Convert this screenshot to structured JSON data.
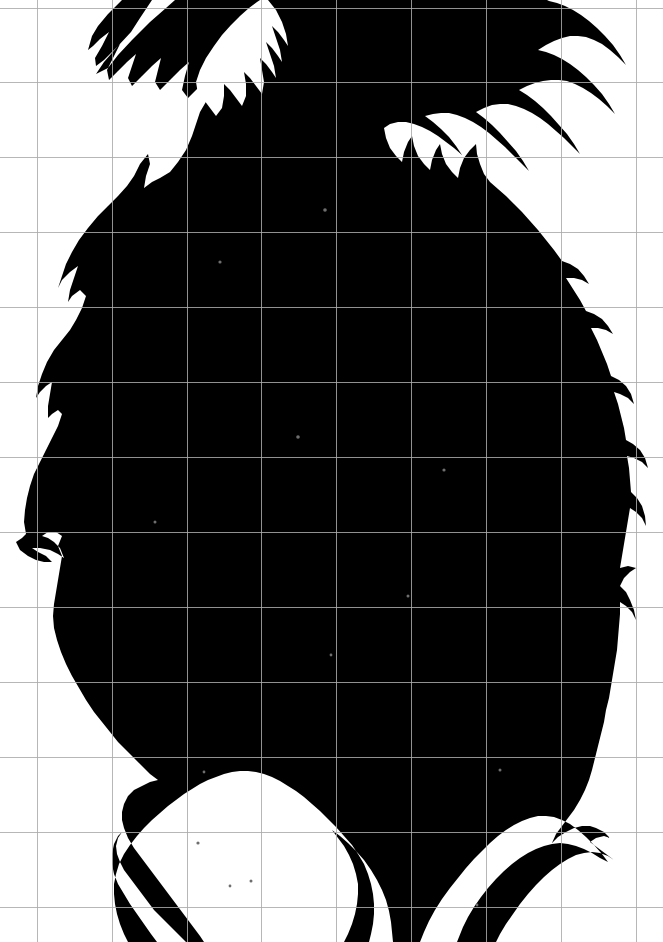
{
  "image": {
    "kind": "photograph-silhouette",
    "subject_label": "pineapple-silhouette",
    "description": "High-contrast black silhouette of a pineapple with a spiky serrated crown of leaves at the top and long serrated leaves at the bottom, photographed against a white background with a faint measurement grid overlay.",
    "width_px": 663,
    "height_px": 942,
    "background_color": "#ffffff",
    "silhouette_color": "#000000",
    "grid_line_color": "#aaaaaa",
    "grid_spacing_px": 74.8,
    "grid_origin_x_px": 37,
    "grid_origin_y_px": 82,
    "grid_vertical_count": 9,
    "grid_horizontal_count": 12,
    "grid_visible": true
  },
  "grid": {
    "vertical_x": [
      37,
      112,
      187,
      261,
      336,
      411,
      486,
      561,
      636
    ],
    "horizontal_y": [
      8,
      82,
      157,
      232,
      307,
      382,
      457,
      532,
      607,
      682,
      757,
      832,
      907
    ]
  },
  "silhouette": {
    "name": "pineapple-silhouette-path",
    "bbox": {
      "x": 18,
      "y": 0,
      "width": 630,
      "height": 942
    },
    "path": "M 175,0 L 166,8 L 150,22 L 132,40 L 118,55 L 108,68 L 96,74 L 104,62 L 118,46 L 131,32 L 140,18 L 148,6 L 152,0 L 122,0 L 108,14 L 98,26 L 92,36 L 88,50 L 93,46 L 100,39 L 109,32 L 102,46 L 95,58 L 96,66 L 104,60 L 112,52 L 120,44 L 113,58 L 107,70 L 109,80 L 118,71 L 127,62 L 136,54 L 132,66 L 128,78 L 132,86 L 142,76 L 152,66 L 161,58 L 158,70 L 155,82 L 160,90 L 170,80 L 180,70 L 189,62 L 185,76 L 182,90 L 188,98 L 198,88 L 208,78 L 212,88 L 207,100 L 200,112 L 196,124 L 192,136 L 186,150 L 178,162 L 170,172 L 160,178 L 152,182 L 144,188 L 146,176 L 150,164 L 148,154 L 140,164 L 134,176 L 127,186 L 118,196 L 108,206 L 98,216 L 88,228 L 79,240 L 72,252 L 66,264 L 62,276 L 58,288 L 62,280 L 70,272 L 78,266 L 74,278 L 70,290 L 68,302 L 72,296 L 80,290 L 86,296 L 82,308 L 76,320 L 70,330 L 62,340 L 54,350 L 47,362 L 42,374 L 38,386 L 36,398 L 40,392 L 46,386 L 52,382 L 50,394 L 48,406 L 48,418 L 52,414 L 58,410 L 62,414 L 58,426 L 52,438 L 46,450 L 40,462 L 34,474 L 30,486 L 27,498 L 25,510 L 24,522 L 26,534 L 22,538 L 16,542 L 20,550 L 28,556 L 36,560 L 44,562 L 52,562 L 46,556 L 38,552 L 32,548 L 40,548 L 50,550 L 58,554 L 64,558 L 60,548 L 54,542 L 48,538 L 42,536 L 48,532 L 56,532 L 62,536 L 58,546 L 62,556 L 60,568 L 58,580 L 56,592 L 54,604 L 53,616 L 54,628 L 57,640 L 61,652 L 66,664 L 72,676 L 79,688 L 86,700 L 94,712 L 102,722 L 110,732 L 118,742 L 126,750 L 134,758 L 142,766 L 150,774 L 158,780 L 150,782 L 142,786 L 134,790 L 128,796 L 124,804 L 122,812 L 122,820 L 124,828 L 128,838 L 134,848 L 140,856 L 146,864 L 152,872 L 158,880 L 164,888 L 170,896 L 176,904 L 182,912 L 188,920 L 194,928 L 200,936 L 204,942 L 186,942 L 178,934 L 170,926 L 162,918 L 154,910 L 148,902 L 142,894 L 136,886 L 130,878 L 124,870 L 120,862 L 117,854 L 116,846 L 118,838 L 122,832 L 118,836 L 114,844 L 112,854 L 112,864 L 114,874 L 118,884 L 124,894 L 130,904 L 137,914 L 144,924 L 151,934 L 157,942 L 128,942 L 124,934 L 120,924 L 117,914 L 115,904 L 114,894 L 114,884 L 116,874 L 119,864 L 124,854 L 130,845 L 137,836 L 144,828 L 152,820 L 160,813 L 168,806 L 176,800 L 184,794 L 192,789 L 200,784 L 208,780 L 216,777 L 224,774 L 232,772 L 240,771 L 248,771 L 256,772 L 264,774 L 272,777 L 280,781 L 288,786 L 296,791 L 304,797 L 312,804 L 320,811 L 328,819 L 336,827 L 344,836 L 352,845 L 358,854 L 364,864 L 368,874 L 371,884 L 373,894 L 374,904 L 374,914 L 373,924 L 371,934 L 369,942 L 344,942 L 348,934 L 352,924 L 355,914 L 357,904 L 358,894 L 358,884 L 356,874 L 353,864 L 349,855 L 344,846 L 338,838 L 332,830 L 340,836 L 348,843 L 356,851 L 364,860 L 371,870 L 377,880 L 382,890 L 386,900 L 389,911 L 391,922 L 392,932 L 393,942 L 420,942 L 424,932 L 429,921 L 435,910 L 442,899 L 450,888 L 458,878 L 466,868 L 474,859 L 482,851 L 490,843 L 498,836 L 506,830 L 514,825 L 522,821 L 530,818 L 538,816 L 546,816 L 554,817 L 562,820 L 570,824 L 578,830 L 586,837 L 594,845 L 602,854 L 608,862 L 600,858 L 592,853 L 584,849 L 576,846 L 568,844 L 560,843 L 552,844 L 544,846 L 536,849 L 528,853 L 520,858 L 512,864 L 504,871 L 496,879 L 488,888 L 481,897 L 474,907 L 468,917 L 463,927 L 459,937 L 457,942 L 496,942 L 500,934 L 506,924 L 513,914 L 520,904 L 528,894 L 536,885 L 544,877 L 552,870 L 560,864 L 568,859 L 576,855 L 584,853 L 592,852 L 600,853 L 608,856 L 614,860 L 606,854 L 598,848 L 590,842 L 596,838 L 604,836 L 610,838 L 604,832 L 596,828 L 590,826 L 582,826 L 574,828 L 566,832 L 558,837 L 552,843 L 556,834 L 562,826 L 568,818 L 574,810 L 580,800 L 585,790 L 589,780 L 592,770 L 595,758 L 598,746 L 601,734 L 604,722 L 606,710 L 609,698 L 611,686 L 613,674 L 615,662 L 617,650 L 618,638 L 619,626 L 620,614 L 620,602 L 626,606 L 632,612 L 636,620 L 634,610 L 630,600 L 626,592 L 620,586 L 624,578 L 630,572 L 636,568 L 628,566 L 620,568 L 622,556 L 624,544 L 626,532 L 628,520 L 630,508 L 636,512 L 642,518 L 646,526 L 645,516 L 642,506 L 637,498 L 631,492 L 630,480 L 629,468 L 627,456 L 634,458 L 642,462 L 648,468 L 645,458 L 640,450 L 633,444 L 626,440 L 624,428 L 621,416 L 618,404 L 614,392 L 620,394 L 628,398 L 634,404 L 631,394 L 626,386 L 619,380 L 611,376 L 607,364 L 602,352 L 597,340 L 591,328 L 598,328 L 606,330 L 613,334 L 608,326 L 602,319 L 594,314 L 586,311 L 580,300 L 573,289 L 566,278 L 574,278 L 582,280 L 589,284 L 584,276 L 578,269 L 570,264 L 562,261 L 554,250 L 546,240 L 538,230 L 530,221 L 522,212 L 514,204 L 506,196 L 498,189 L 490,182 L 484,174 L 480,164 L 477,154 L 476,144 L 470,150 L 464,158 L 460,168 L 458,178 L 452,172 L 446,164 L 442,154 L 440,144 L 436,150 L 432,160 L 430,170 L 424,164 L 418,156 L 414,146 L 412,136 L 408,142 L 404,152 L 402,162 L 396,156 L 390,148 L 386,138 L 384,128 L 390,124 L 398,122 L 406,122 L 414,124 L 422,127 L 430,131 L 438,136 L 446,142 L 454,148 L 462,155 L 456,146 L 449,137 L 441,129 L 433,122 L 425,116 L 433,114 L 441,113 L 449,113 L 457,115 L 465,118 L 473,122 L 481,127 L 489,133 L 497,140 L 505,147 L 513,155 L 521,163 L 529,171 L 523,161 L 516,151 L 508,142 L 500,133 L 492,125 L 484,118 L 476,112 L 484,108 L 492,105 L 500,104 L 508,104 L 516,106 L 524,109 L 532,113 L 540,118 L 548,124 L 556,131 L 564,138 L 572,146 L 580,154 L 574,144 L 567,134 L 559,125 L 551,116 L 543,108 L 535,101 L 527,95 L 519,90 L 527,86 L 535,83 L 543,81 L 551,80 L 559,80 L 567,81 L 575,84 L 583,88 L 591,93 L 599,99 L 607,106 L 615,114 L 609,104 L 602,94 L 594,85 L 586,77 L 578,70 L 570,64 L 562,59 L 554,55 L 546,52 L 538,50 L 546,45 L 554,41 L 562,38 L 570,36 L 578,36 L 586,37 L 594,40 L 602,44 L 610,50 L 618,57 L 626,65 L 620,55 L 613,45 L 605,36 L 597,28 L 589,21 L 581,15 L 573,10 L 565,6 L 557,3 L 549,1 L 547,0 Z",
    "interior_holes": [
      "M 268,0 L 276,10 L 282,22 L 286,34 L 288,46 L 284,40 L 278,32 L 272,26 L 276,38 L 280,50 L 282,62 L 278,56 L 272,48 L 266,42 L 270,54 L 274,66 L 276,78 L 272,72 L 266,64 L 260,58 L 262,70 L 264,82 L 262,94 L 256,86 L 250,78 L 244,72 L 246,84 L 246,96 L 242,106 L 236,98 L 230,90 L 224,84 L 224,96 L 222,108 L 216,116 L 210,108 L 204,100 L 198,94 L 196,82 L 200,70 L 206,58 L 214,46 L 222,35 L 231,25 L 240,16 L 249,8 L 257,2 L 260,0 Z"
    ]
  },
  "speckles": [
    {
      "x": 220,
      "y": 262,
      "r": 1.6
    },
    {
      "x": 325,
      "y": 210,
      "r": 1.8
    },
    {
      "x": 298,
      "y": 437,
      "r": 1.8
    },
    {
      "x": 444,
      "y": 470,
      "r": 1.6
    },
    {
      "x": 155,
      "y": 522,
      "r": 1.5
    },
    {
      "x": 408,
      "y": 596,
      "r": 1.5
    },
    {
      "x": 331,
      "y": 655,
      "r": 1.4
    },
    {
      "x": 204,
      "y": 772,
      "r": 1.4
    },
    {
      "x": 500,
      "y": 770,
      "r": 1.5
    },
    {
      "x": 198,
      "y": 843,
      "r": 1.6
    },
    {
      "x": 251,
      "y": 881,
      "r": 1.5
    },
    {
      "x": 230,
      "y": 886,
      "r": 1.4
    },
    {
      "x": 477,
      "y": 905,
      "r": 1.4
    }
  ],
  "meta": {
    "visible_text": "",
    "has_ui_controls": false
  }
}
